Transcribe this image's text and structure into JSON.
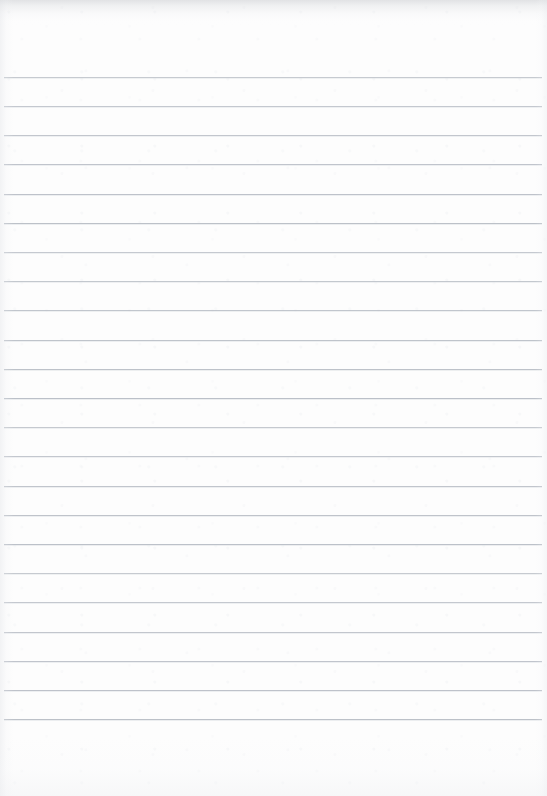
{
  "document": {
    "kind": "lined-notebook-paper-scan",
    "title": "Blank lined paper",
    "page_width": 547,
    "page_height": 796,
    "background_color": "#fdfdfd",
    "has_visible_text": false,
    "has_handwriting": false,
    "has_margin_rule": false,
    "has_holes": false,
    "written_content": ""
  },
  "ruling": {
    "line_color": "#b9bec6",
    "line_thickness_px": 1,
    "line_count": 23,
    "spacing_px": 29.2,
    "first_line_y": 77,
    "last_line_y": 719,
    "left_inset_px": 4,
    "right_inset_px": 5,
    "top_margin_px": 77,
    "bottom_margin_px": 77,
    "lines_y": [
      77,
      106,
      135,
      164,
      194,
      223,
      252,
      281,
      310,
      340,
      369,
      398,
      427,
      456,
      486,
      515,
      544,
      573,
      602,
      632,
      661,
      690,
      719
    ]
  },
  "scan_artifacts": {
    "top_edge_shadow": true,
    "left_edge_shadow": true,
    "right_edge_shadow": true,
    "bottom_edge_mottling": true,
    "grain": true
  }
}
